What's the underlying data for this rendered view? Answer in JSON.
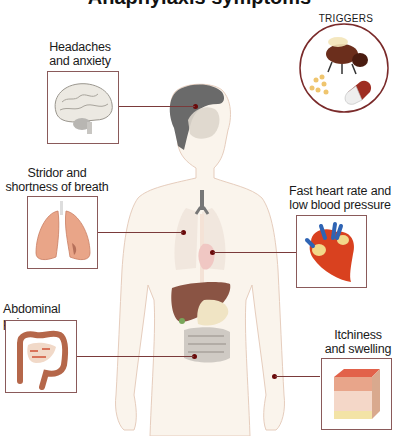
{
  "title": "Anaphylaxis symptoms",
  "triggers": {
    "label": "TRIGGERS",
    "items": [
      "bee-sting",
      "food-allergen",
      "medication"
    ]
  },
  "symptoms": [
    {
      "id": "head",
      "label_line1": "Headaches",
      "label_line2": "and anxiety",
      "organ": "brain"
    },
    {
      "id": "lungs",
      "label_line1": "Stridor and",
      "label_line2": "shortness of breath",
      "organ": "lungs"
    },
    {
      "id": "heart",
      "label_line1": "Fast heart rate and",
      "label_line2": "low blood pressure",
      "organ": "heart"
    },
    {
      "id": "abdomen",
      "label_line1": "Abdominal pain",
      "label_line2": "",
      "organ": "intestines"
    },
    {
      "id": "skin",
      "label_line1": "Itchiness",
      "label_line2": "and swelling",
      "organ": "skin"
    }
  ],
  "colors": {
    "connector": "#7a3a3a",
    "box_border": "#8a5a5a",
    "body_fill": "#faf4ec",
    "body_outline": "#e2c9b8"
  }
}
